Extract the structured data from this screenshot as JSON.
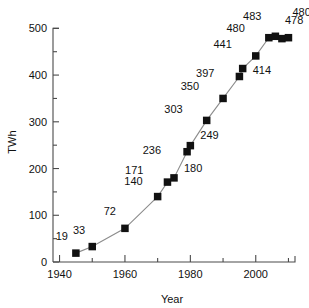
{
  "chart_data": {
    "type": "line",
    "title": "",
    "subtitle": "",
    "xlabel": "Year",
    "ylabel": "TWh",
    "xlim": [
      1938,
      2012
    ],
    "ylim": [
      0,
      520
    ],
    "grid": false,
    "legend": "none",
    "x_major_ticks": [
      1940,
      1960,
      1980,
      2000
    ],
    "x_minor_ticks": [
      1950,
      1970,
      1990,
      2010
    ],
    "y_major_ticks": [
      0,
      100,
      200,
      300,
      400,
      500
    ],
    "y_minor_ticks": [
      50,
      150,
      250,
      350,
      450
    ],
    "x_tick_labels": [
      "1940",
      "1960",
      "1980",
      "2000"
    ],
    "y_tick_labels": [
      "0",
      "100",
      "200",
      "300",
      "400",
      "500"
    ],
    "marker": "filled-square",
    "points": [
      {
        "x": 1945,
        "y": 19,
        "label": "19",
        "lx": -8,
        "ly": -13
      },
      {
        "x": 1950,
        "y": 33,
        "label": "33",
        "lx": -7,
        "ly": -13
      },
      {
        "x": 1960,
        "y": 72,
        "label": "72",
        "lx": -9,
        "ly": -13
      },
      {
        "x": 1970,
        "y": 140,
        "label": "140",
        "lx": -15,
        "ly": -12
      },
      {
        "x": 1973,
        "y": 171,
        "label": "171",
        "lx": -24,
        "ly": -8
      },
      {
        "x": 1975,
        "y": 180,
        "label": "180",
        "lx": 10,
        "ly": -6
      },
      {
        "x": 1979,
        "y": 236,
        "label": "236",
        "lx": -26,
        "ly": 2
      },
      {
        "x": 1980,
        "y": 249,
        "label": "249",
        "lx": 10,
        "ly": -7
      },
      {
        "x": 1985,
        "y": 303,
        "label": "303",
        "lx": -24,
        "ly": -7
      },
      {
        "x": 1990,
        "y": 350,
        "label": "350",
        "lx": -24,
        "ly": -8
      },
      {
        "x": 1995,
        "y": 397,
        "label": "397",
        "lx": -25,
        "ly": 1
      },
      {
        "x": 1996,
        "y": 414,
        "label": "414",
        "lx": 10,
        "ly": 5
      },
      {
        "x": 2000,
        "y": 441,
        "label": "441",
        "lx": -24,
        "ly": -8
      },
      {
        "x": 2004,
        "y": 480,
        "label": "480",
        "lx": -24,
        "ly": -6
      },
      {
        "x": 2006,
        "y": 483,
        "label": "483",
        "lx": -14,
        "ly": -16
      },
      {
        "x": 2008,
        "y": 478,
        "label": "478",
        "lx": 3,
        "ly": -15
      },
      {
        "x": 2010,
        "y": 480,
        "label": "480",
        "lx": 4,
        "ly": -22
      }
    ],
    "colors": {
      "marker": "#111111",
      "line": "#8c8c8c",
      "axis": "#4a4a4a",
      "text": "#111111",
      "background": "#ffffff"
    }
  }
}
